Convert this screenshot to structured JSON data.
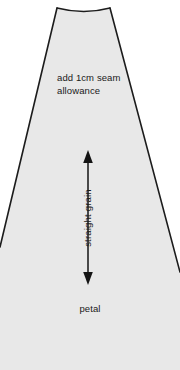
{
  "document": {
    "type": "sewing-pattern-piece",
    "width_px": 180,
    "height_px": 370
  },
  "pattern": {
    "piece_name": "petal",
    "seam_allowance_note_line1": "add 1cm seam",
    "seam_allowance_note_line2": "allowance",
    "seam_allowance_note": "add 1cm seam\nallowance",
    "grain_line_label": "straight grain",
    "grain_line_arrow": "double-headed-arrow"
  },
  "colors": {
    "page_background": "#ffffff",
    "piece_fill": "#e8e8e8",
    "piece_outline": "#1c1c1c",
    "text": "#1a1a1a",
    "arrow": "#141414"
  },
  "geometry": {
    "top_left": [
      57,
      8
    ],
    "top_right": [
      110,
      8
    ],
    "top_edge_curve": "concave",
    "top_edge_control": [
      84,
      14
    ],
    "left_edge_exit": [
      0,
      247
    ],
    "right_edge_exit": [
      180,
      272
    ],
    "grain_arrow_x": 88,
    "grain_arrow_top_y": 152,
    "grain_arrow_bottom_y": 283
  }
}
